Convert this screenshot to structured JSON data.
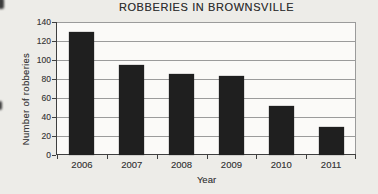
{
  "page": {
    "background": "#edece8"
  },
  "chart_data": {
    "type": "bar",
    "title": "ROBBERIES IN BROWNSVILLE",
    "xlabel": "Year",
    "ylabel": "Number of robberies",
    "categories": [
      "2006",
      "2007",
      "2008",
      "2009",
      "2010",
      "2011"
    ],
    "values": [
      130,
      95,
      85,
      83,
      52,
      30
    ],
    "ylim": [
      0,
      140
    ],
    "yticks": [
      0,
      20,
      40,
      60,
      80,
      100,
      120,
      140
    ],
    "grid": "horizontal",
    "legend": "none",
    "bar_color": "#1f1f1f",
    "grid_color": "#9b9b9b",
    "axis_color": "#3f3f3f",
    "text_color": "#3a3a3a",
    "plot_background": "#fbfaf8"
  }
}
